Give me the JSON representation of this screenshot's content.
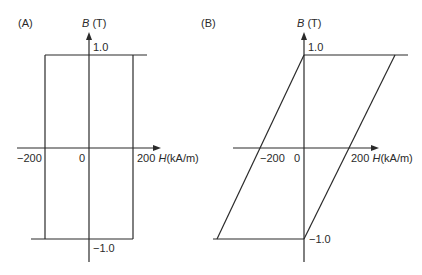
{
  "panels": [
    {
      "label": "(A)",
      "y_axis": {
        "symbol": "B",
        "unit": "(T)",
        "top_tick": "1.0",
        "bottom_tick": "−1.0"
      },
      "x_axis": {
        "symbol": "H",
        "unit": "(kA/m)",
        "left_tick": "−200",
        "origin": "0",
        "right_tick": "200"
      },
      "shape": "rectangular hysteresis loop",
      "loop_points": [
        [
          -200,
          1.0
        ],
        [
          200,
          1.0
        ],
        [
          200,
          -1.0
        ],
        [
          -200,
          -1.0
        ]
      ]
    },
    {
      "label": "(B)",
      "y_axis": {
        "symbol": "B",
        "unit": "(T)",
        "top_tick": "1.0",
        "bottom_tick": "−1.0"
      },
      "x_axis": {
        "symbol": "H",
        "unit": "(kA/m)",
        "left_tick": "−200",
        "origin": "0",
        "right_tick": "200"
      },
      "shape": "sheared (parallelogram) hysteresis loop",
      "loop_points": [
        [
          0,
          1.0
        ],
        [
          400,
          1.0
        ],
        [
          0,
          -1.0
        ],
        [
          -400,
          -1.0
        ]
      ]
    }
  ],
  "colors": {
    "line": "#2a2a2a",
    "background": "#ffffff"
  }
}
